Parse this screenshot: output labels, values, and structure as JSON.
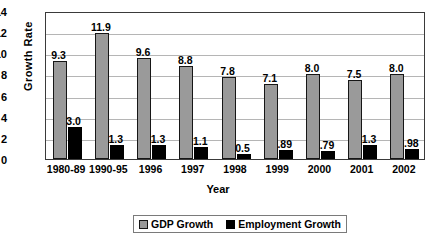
{
  "chart_data": {
    "type": "bar",
    "title": "",
    "xlabel": "Year",
    "ylabel": "Growth Rate",
    "ylim": [
      0,
      14
    ],
    "ytick_step": 2,
    "yticks": [
      "0",
      "2",
      "4",
      "6",
      "8",
      "10",
      "12",
      "14"
    ],
    "grid": true,
    "legend_position": "bottom",
    "categories": [
      "1980-89",
      "1990-95",
      "1996",
      "1997",
      "1998",
      "1999",
      "2000",
      "2001",
      "2002"
    ],
    "series": [
      {
        "name": "GDP Growth",
        "color": "#9a9a9a",
        "values": [
          9.3,
          11.9,
          9.6,
          8.8,
          7.8,
          7.1,
          8.0,
          7.5,
          8.0
        ],
        "labels": [
          "9.3",
          "11.9",
          "9.6",
          "8.8",
          "7.8",
          "7.1",
          "8.0",
          "7.5",
          "8.0"
        ]
      },
      {
        "name": "Employment Growth",
        "color": "#000000",
        "values": [
          3.0,
          1.3,
          1.3,
          1.1,
          0.5,
          0.89,
          0.79,
          1.3,
          0.98
        ],
        "labels": [
          "3.0",
          "1.3",
          "1.3",
          "1.1",
          "0.5",
          ".89",
          ".79",
          "1.3",
          ".98"
        ]
      }
    ]
  },
  "legend": {
    "items": [
      {
        "label": "GDP Growth",
        "swatch": "gdp"
      },
      {
        "label": "Employment Growth",
        "swatch": "emp"
      }
    ]
  }
}
